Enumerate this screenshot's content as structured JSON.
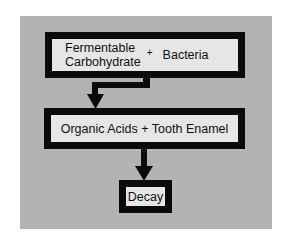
{
  "diagram": {
    "title": "",
    "nodes": [
      {
        "id": "inputs",
        "left_text_line1": "Fermentable",
        "left_text_line2": "Carbohydrate",
        "operator": "+",
        "right_text": "Bacteria"
      },
      {
        "id": "reaction",
        "text": "Organic Acids + Tooth Enamel"
      },
      {
        "id": "result",
        "text": "Decay"
      }
    ],
    "edges": [
      {
        "from": "inputs",
        "to": "reaction",
        "style": "elbow-arrow"
      },
      {
        "from": "reaction",
        "to": "result",
        "style": "straight-arrow"
      }
    ],
    "colors": {
      "background": "#ffffff",
      "panel": "#b3b3b3",
      "box_fill": "#e6e6e6",
      "border": "#0a0a0a"
    }
  }
}
